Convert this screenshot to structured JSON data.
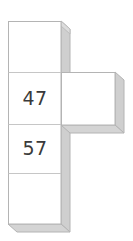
{
  "figure": {
    "name": "cube-net-diagram",
    "type": "cube-net",
    "background_color": "#ffffff",
    "face_color": "#ffffff",
    "outline_color": "#b4b4b4",
    "shadow_color": "#cfcfcf",
    "label_color": "#3a3a3a",
    "square_size_px": 53,
    "faces": [
      {
        "id": "face-top",
        "label": "",
        "row": 1,
        "column": 1,
        "x": 8,
        "y": 21,
        "has_label": false
      },
      {
        "id": "face-upper-mid",
        "label": "47",
        "row": 2,
        "column": 1,
        "x": 8,
        "y": 72,
        "has_label": true
      },
      {
        "id": "face-right",
        "label": "",
        "row": 2,
        "column": 2,
        "x": 62,
        "y": 72,
        "has_label": false
      },
      {
        "id": "face-lower-mid",
        "label": "57",
        "row": 3,
        "column": 1,
        "x": 8,
        "y": 124,
        "has_label": true
      },
      {
        "id": "face-bottom",
        "label": "",
        "row": 4,
        "column": 1,
        "x": 8,
        "y": 173,
        "has_label": false
      }
    ],
    "labels": [
      {
        "id": "label-47",
        "text": "47",
        "x": 8,
        "y": 72,
        "width": 54,
        "height": 52
      },
      {
        "id": "label-57",
        "text": "57",
        "x": 8,
        "y": 124,
        "width": 54,
        "height": 49
      }
    ]
  }
}
